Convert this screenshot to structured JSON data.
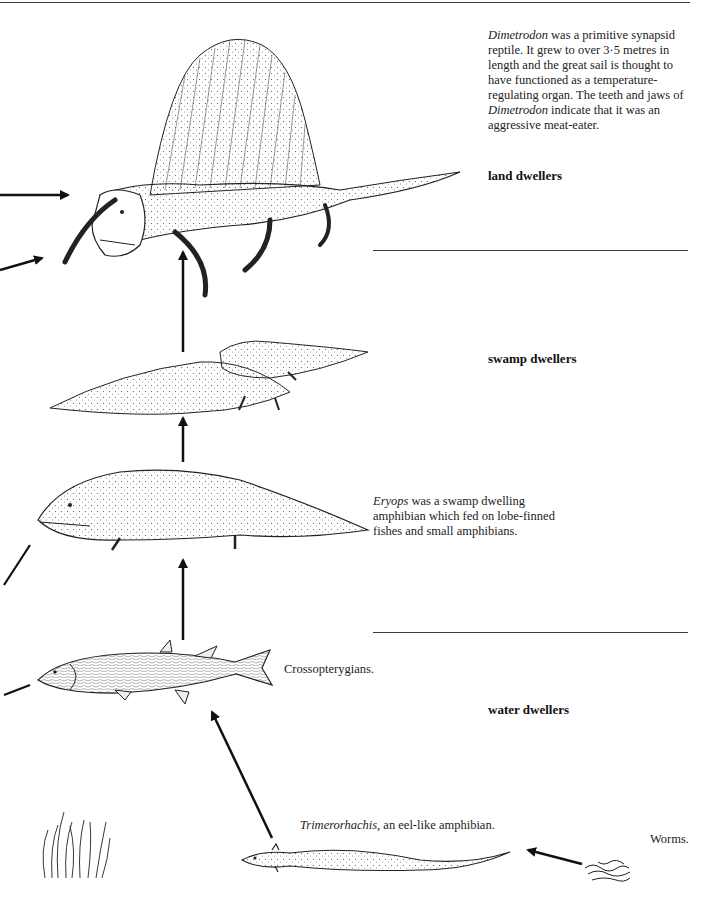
{
  "diagram": {
    "zones": [
      {
        "id": "land",
        "label": "land dwellers"
      },
      {
        "id": "swamp",
        "label": "swamp dwellers"
      },
      {
        "id": "water",
        "label": "water dwellers"
      }
    ],
    "captions": {
      "dimetrodon": {
        "italic_1": "Dimetrodon",
        "text_1": " was a primitive synapsid reptile. It grew to over 3·5 metres in length and the great sail is thought to have functioned as a temperature-regulating organ. The teeth and jaws of ",
        "italic_2": "Dimetrodon",
        "text_2": " indicate that it was an aggressive meat-eater."
      },
      "eryops": {
        "italic": "Eryops",
        "text": " was a swamp dwelling amphibian which fed on lobe-finned fishes and small amphibians."
      },
      "crossopterygians": {
        "text": "Crossopterygians."
      },
      "trimerorhachis": {
        "italic": "Trimerorhachis",
        "text": ", an eel-like amphibian."
      },
      "worms": {
        "text": "Worms."
      }
    },
    "organisms": [
      {
        "name": "Dimetrodon",
        "zone": "land"
      },
      {
        "name": "swamp reptiles",
        "zone": "swamp"
      },
      {
        "name": "Eryops",
        "zone": "swamp"
      },
      {
        "name": "Crossopterygian fish",
        "zone": "water"
      },
      {
        "name": "Trimerorhachis",
        "zone": "water"
      },
      {
        "name": "Worms",
        "zone": "water"
      },
      {
        "name": "Seaweed",
        "zone": "water"
      }
    ],
    "colors": {
      "ink": "#1a1a1a",
      "rule": "#3a3a3a",
      "paper": "#ffffff"
    }
  }
}
